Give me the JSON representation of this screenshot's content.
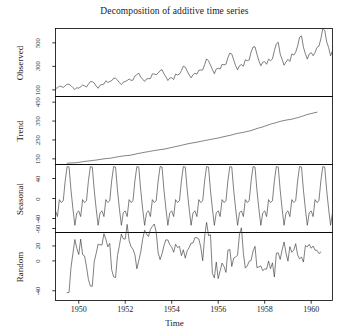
{
  "chart_data": {
    "type": "line",
    "title": "Decomposition of additive time series",
    "xlabel": "Time",
    "ylabel": "",
    "grid": false,
    "legend": "none",
    "xlim": [
      1949.0,
      1960.917
    ],
    "x_ticks": [
      1950,
      1952,
      1954,
      1956,
      1958,
      1960
    ],
    "x_tick_labels": [
      "1950",
      "1952",
      "1954",
      "1956",
      "1958",
      "1960"
    ],
    "frequency": 12,
    "start_year": 1949,
    "n": 144,
    "panels": [
      {
        "name": "observed",
        "label": "Observed",
        "ylim": [
          44,
          622
        ],
        "y_ticks": [
          100,
          300,
          500
        ],
        "y_tick_labels": [
          "100",
          "300",
          "500"
        ],
        "values": [
          112,
          118,
          132,
          129,
          121,
          135,
          148,
          148,
          136,
          119,
          104,
          118,
          115,
          126,
          141,
          135,
          125,
          149,
          170,
          170,
          158,
          133,
          114,
          140,
          145,
          150,
          178,
          163,
          172,
          178,
          199,
          199,
          184,
          162,
          146,
          166,
          171,
          180,
          193,
          181,
          183,
          218,
          230,
          242,
          209,
          191,
          172,
          194,
          196,
          196,
          236,
          235,
          229,
          243,
          264,
          272,
          237,
          211,
          180,
          201,
          204,
          188,
          235,
          227,
          234,
          264,
          302,
          293,
          259,
          229,
          203,
          229,
          242,
          233,
          267,
          269,
          270,
          315,
          364,
          347,
          312,
          274,
          237,
          278,
          284,
          277,
          317,
          313,
          318,
          374,
          413,
          405,
          355,
          306,
          271,
          306,
          315,
          301,
          356,
          348,
          355,
          422,
          465,
          467,
          404,
          347,
          305,
          336,
          340,
          318,
          362,
          348,
          363,
          435,
          491,
          505,
          404,
          359,
          310,
          337,
          360,
          342,
          406,
          396,
          420,
          472,
          548,
          559,
          463,
          407,
          362,
          405,
          417,
          391,
          419,
          461,
          472,
          535,
          622,
          606,
          508,
          461,
          390,
          432
        ]
      },
      {
        "name": "trend",
        "label": "Trend",
        "ylim": [
          120,
          480
        ],
        "y_ticks": [
          150,
          250,
          350,
          450
        ],
        "y_tick_labels": [
          "150",
          "250",
          "350",
          "450"
        ],
        "values": [
          null,
          null,
          null,
          null,
          null,
          null,
          126.79,
          127.25,
          127.96,
          128.58,
          129.0,
          129.75,
          131.25,
          133.08,
          134.92,
          136.42,
          137.42,
          138.54,
          139.79,
          141.13,
          142.33,
          143.46,
          145.21,
          147.13,
          148.42,
          149.83,
          151.25,
          152.25,
          153.0,
          154.25,
          156.5,
          158.58,
          160.42,
          162.08,
          163.58,
          165.08,
          166.58,
          167.42,
          168.21,
          169.96,
          172.0,
          174.33,
          176.75,
          178.79,
          180.67,
          182.63,
          184.67,
          186.54,
          188.08,
          190.21,
          192.0,
          193.63,
          195.17,
          197.0,
          198.54,
          199.54,
          201.42,
          203.38,
          205.62,
          207.96,
          210.33,
          212.63,
          214.96,
          217.04,
          219.17,
          221.58,
          224.25,
          226.54,
          228.75,
          230.96,
          232.83,
          234.67,
          236.5,
          238.33,
          240.38,
          242.42,
          244.5,
          246.71,
          248.54,
          250.46,
          252.67,
          254.58,
          256.42,
          258.0,
          260.08,
          262.5,
          265.08,
          267.58,
          269.88,
          272.04,
          274.25,
          276.83,
          279.63,
          282.42,
          284.92,
          286.83,
          288.42,
          290.29,
          292.67,
          295.08,
          297.33,
          299.92,
          303.17,
          306.54,
          310.25,
          313.5,
          316.38,
          319.17,
          322.75,
          326.17,
          329.67,
          333.5,
          336.71,
          339.08,
          342.0,
          345.5,
          348.25,
          350.58,
          352.71,
          354.92,
          356.87,
          358.25,
          360.13,
          362.75,
          365.42,
          367.96,
          371.0,
          374.25,
          377.83,
          381.29,
          384.58,
          387.25,
          389.79,
          392.08,
          394.5,
          396.88,
          null,
          null,
          null,
          null,
          null,
          null
        ]
      },
      {
        "name": "seasonal",
        "label": "Seasonal",
        "ylim": [
          -68,
          68
        ],
        "y_ticks": [
          -60,
          -40,
          0,
          40
        ],
        "y_tick_labels": [
          "-60",
          "-40",
          "0",
          "40"
        ],
        "pattern": [
          -24.75,
          -36.19,
          -2.24,
          -8.04,
          -4.51,
          35.4,
          63.83,
          62.82,
          16.52,
          -20.64,
          -53.59,
          -28.62
        ]
      },
      {
        "name": "random",
        "label": "Random",
        "ylim": [
          -53,
          38
        ],
        "y_ticks": [
          -40,
          0,
          20
        ],
        "y_tick_labels": [
          "-40",
          "0",
          "20"
        ],
        "values": [
          null,
          null,
          null,
          null,
          null,
          null,
          -42.62,
          -42.07,
          -8.48,
          10.06,
          28.59,
          16.87,
          8.5,
          29.11,
          8.32,
          6.62,
          -7.91,
          -24.94,
          -33.62,
          -33.95,
          -0.85,
          10.18,
          22.38,
          21.49,
          21.33,
          36.36,
          28.99,
          18.79,
          23.51,
          -11.65,
          -21.33,
          -22.4,
          7.06,
          20.56,
          36.01,
          29.54,
          29.17,
          48.77,
          27.03,
          19.08,
          15.51,
          8.27,
          -10.58,
          0.39,
          11.81,
          29.01,
          40.92,
          36.08,
          32.67,
          41.99,
          46.24,
          49.41,
          38.34,
          10.6,
          1.63,
          9.64,
          20.33,
          28.26,
          27.97,
          21.66,
          18.42,
          11.56,
          22.28,
          18.0,
          19.34,
          7.02,
          14.92,
          3.64,
          13.73,
          17.68,
          23.76,
          23.95,
          31.25,
          30.86,
          29.37,
          18.54,
          0.25,
          32.89,
          51.62,
          33.72,
          35.08,
          -16.78,
          -22.66,
          -1.59,
          -23.67,
          -13.12,
          -2.92,
          -7.45,
          -15.4,
          14.21,
          15.34,
          -7.48,
          3.78,
          5.19,
          7.83,
          36.17,
          44.31,
          10.21,
          -9.69,
          -6.69,
          -0.41,
          0.59,
          13.2,
          19.46,
          -9.01,
          -8.02,
          -6.77,
          -12.97,
          -10.88,
          -11.01,
          -0.31,
          -10.42,
          -2.51,
          -21.6,
          10.18,
          10.74,
          1.98,
          14.79,
          25.27,
          10.5,
          -0.37,
          19.13,
          11.52,
          14.17,
          23.04,
          8.03,
          2.78,
          5.15,
          -1.57,
          20.35,
          18.77,
          22.25,
          16.94,
          19.88,
          14.39,
          14.09,
          9.76,
          11.97,
          null,
          null,
          null,
          null,
          null,
          null
        ]
      }
    ]
  },
  "axis": {
    "x_title": "Time"
  }
}
